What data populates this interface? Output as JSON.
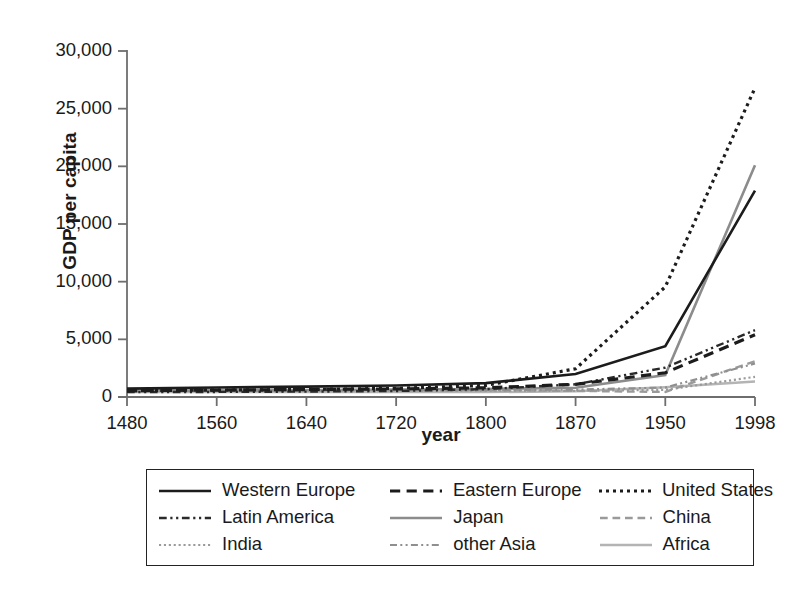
{
  "chart_data": {
    "type": "line",
    "title": "",
    "xlabel": "year",
    "ylabel": "GDP per capita",
    "grid": false,
    "legend_position": "below-plot",
    "categories": [
      "1480",
      "1560",
      "1640",
      "1720",
      "1800",
      "1870",
      "1950",
      "1998"
    ],
    "x_tick_labels": [
      "1480",
      "1560",
      "1640",
      "1720",
      "1800",
      "1870",
      "1950",
      "1998"
    ],
    "y_tick_labels": [
      "0",
      "5,000",
      "10,000",
      "15,000",
      "20,000",
      "25,000",
      "30,000"
    ],
    "y_ticks": [
      0,
      5000,
      10000,
      15000,
      20000,
      25000,
      30000
    ],
    "ylim": [
      0,
      30000
    ],
    "series": [
      {
        "name": "Western Europe",
        "style": "solid",
        "color": "#1c1c1c",
        "width": 2.6,
        "values": [
          730,
          830,
          900,
          1000,
          1200,
          2000,
          4400,
          17900
        ]
      },
      {
        "name": "Eastern Europe",
        "style": "dashed",
        "color": "#1c1c1c",
        "width": 3.2,
        "values": [
          550,
          600,
          650,
          700,
          800,
          1100,
          2100,
          5400
        ]
      },
      {
        "name": "United States",
        "style": "dotted",
        "color": "#1c1c1c",
        "width": 3.2,
        "values": [
          550,
          600,
          650,
          750,
          1000,
          2450,
          9550,
          26800
        ]
      },
      {
        "name": "Latin America",
        "style": "dashdotdot",
        "color": "#2a2a2a",
        "width": 2.4,
        "values": [
          420,
          440,
          470,
          520,
          680,
          1100,
          2550,
          5800
        ]
      },
      {
        "name": "Japan",
        "style": "solid",
        "color": "#8c8c8c",
        "width": 2.6,
        "values": [
          520,
          560,
          600,
          650,
          700,
          800,
          1900,
          20100
        ]
      },
      {
        "name": "China",
        "style": "dashed",
        "color": "#9a9a9a",
        "width": 2.4,
        "values": [
          600,
          600,
          600,
          600,
          600,
          530,
          440,
          3100
        ]
      },
      {
        "name": "India",
        "style": "dotted",
        "color": "#9a9a9a",
        "width": 2.2,
        "values": [
          550,
          550,
          550,
          550,
          530,
          530,
          620,
          1750
        ]
      },
      {
        "name": "other Asia",
        "style": "dashdotdot",
        "color": "#8f8f8f",
        "width": 2.2,
        "values": [
          560,
          560,
          570,
          580,
          590,
          640,
          820,
          2900
        ]
      },
      {
        "name": "Africa",
        "style": "solid",
        "color": "#b4b4b4",
        "width": 2.4,
        "values": [
          420,
          430,
          430,
          420,
          420,
          500,
          850,
          1350
        ]
      }
    ]
  },
  "legend": {
    "rows": [
      [
        {
          "label": "Western Europe",
          "style": "solid",
          "color": "#1c1c1c",
          "width": 2.6
        },
        {
          "label": "Eastern Europe",
          "style": "dashed",
          "color": "#1c1c1c",
          "width": 3.2
        },
        {
          "label": "United States",
          "style": "dotted",
          "color": "#1c1c1c",
          "width": 3.2
        }
      ],
      [
        {
          "label": "Latin America",
          "style": "dashdotdot",
          "color": "#2a2a2a",
          "width": 2.4
        },
        {
          "label": "Japan",
          "style": "solid",
          "color": "#8c8c8c",
          "width": 2.6
        },
        {
          "label": "China",
          "style": "dashed",
          "color": "#9a9a9a",
          "width": 2.4
        }
      ],
      [
        {
          "label": "India",
          "style": "dotted",
          "color": "#9a9a9a",
          "width": 2.2
        },
        {
          "label": "other Asia",
          "style": "dashdotdot",
          "color": "#8f8f8f",
          "width": 2.2
        },
        {
          "label": "Africa",
          "style": "solid",
          "color": "#b4b4b4",
          "width": 2.4
        }
      ]
    ]
  },
  "axis": {
    "color": "#6e6e6e",
    "tick_color": "#6e6e6e"
  }
}
